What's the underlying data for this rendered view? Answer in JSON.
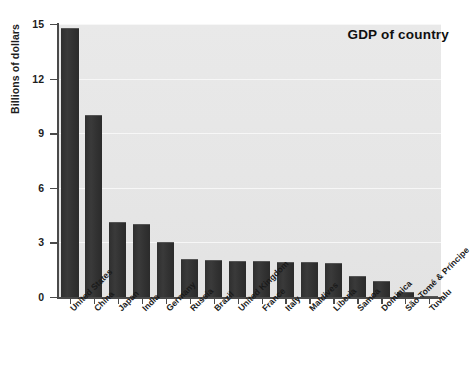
{
  "chart_data": {
    "type": "bar",
    "title": "GDP of country",
    "xlabel": "",
    "ylabel": "Billions of dollars",
    "ylim": [
      0,
      15
    ],
    "yticks": [
      0,
      3,
      6,
      9,
      12,
      15
    ],
    "grid": true,
    "legend": "none",
    "bar_color": "#333333",
    "plot_background": "#e7e7e7",
    "gridline_color": "#f7f7f7",
    "axis_color": "#4a4a4a",
    "categories": [
      "United States",
      "China",
      "Japan",
      "India",
      "Germany",
      "Russia",
      "Brazil",
      "United Kingdom",
      "France",
      "Italy",
      "Maldives",
      "Liberia",
      "Samoa",
      "Dominica",
      "São Tomé & Príncipe",
      "Tuvalu"
    ],
    "values": [
      14.8,
      10.0,
      4.15,
      4.0,
      3.05,
      2.1,
      2.05,
      2.0,
      2.0,
      1.95,
      1.9,
      1.85,
      1.15,
      0.9,
      0.25,
      0.04
    ]
  }
}
